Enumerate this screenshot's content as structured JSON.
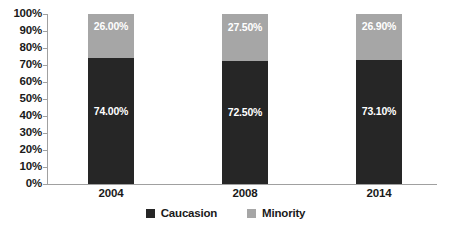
{
  "chart_data": {
    "type": "bar",
    "subtype": "stacked-100-percent",
    "title": "",
    "xlabel": "",
    "ylabel": "",
    "categories": [
      "2004",
      "2008",
      "2014"
    ],
    "series": [
      {
        "name": "Caucasion",
        "color": "#262626",
        "values": [
          74.0,
          72.5,
          73.1
        ],
        "labels": [
          "74.00%",
          "72.50%",
          "73.10%"
        ]
      },
      {
        "name": "Minority",
        "color": "#a6a6a6",
        "values": [
          26.0,
          27.5,
          26.9
        ],
        "labels": [
          "26.00%",
          "27.50%",
          "26.90%"
        ]
      }
    ],
    "ylim": [
      0,
      100
    ],
    "y_tick_values": [
      0,
      10,
      20,
      30,
      40,
      50,
      60,
      70,
      80,
      90,
      100
    ],
    "y_tick_labels": [
      "0%",
      "10%",
      "20%",
      "30%",
      "40%",
      "50%",
      "60%",
      "70%",
      "80%",
      "90%",
      "100%"
    ],
    "grid": false,
    "legend_position": "bottom",
    "legend_entries": [
      "Caucasion",
      "Minority"
    ]
  },
  "axis": {
    "y_labels": [
      "100%",
      "90%",
      "80%",
      "70%",
      "60%",
      "50%",
      "40%",
      "30%",
      "20%",
      "10%",
      "0%"
    ],
    "x_labels": [
      "2004",
      "2008",
      "2014"
    ]
  },
  "legend": {
    "items": [
      {
        "label": "Caucasion",
        "color": "#262626"
      },
      {
        "label": "Minority",
        "color": "#a6a6a6"
      }
    ]
  },
  "colors": {
    "caucasion": "#262626",
    "minority": "#a6a6a6",
    "axis": "#a0a0a0",
    "text": "#1a1a1a",
    "background": "#ffffff"
  }
}
